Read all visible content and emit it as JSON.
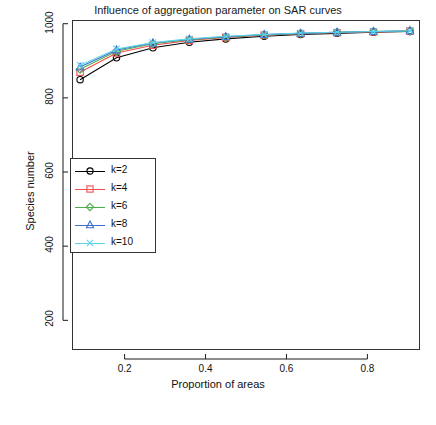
{
  "chart_data": {
    "type": "line",
    "title": "Influence of aggregation parameter on SAR curves",
    "xlabel": "Proportion of areas",
    "ylabel": "Species number",
    "xlim": [
      0.07,
      0.93
    ],
    "ylim": [
      120,
      1010
    ],
    "xticks": [
      "0.2",
      "0.4",
      "0.6",
      "0.8"
    ],
    "xtick_values": [
      0.2,
      0.4,
      0.6,
      0.8
    ],
    "yticks": [
      "200",
      "400",
      "600",
      "800",
      "1000"
    ],
    "ytick_values": [
      200,
      400,
      600,
      800,
      1000
    ],
    "grid": false,
    "legend_position": "left-middle",
    "x": [
      0.09,
      0.18,
      0.27,
      0.36,
      0.45,
      0.545,
      0.635,
      0.725,
      0.815,
      0.905
    ],
    "series": [
      {
        "name": "k=2",
        "color": "#000000",
        "marker": "circle",
        "values": [
          849,
          908,
          935,
          950,
          959,
          966,
          971,
          974,
          977,
          979
        ]
      },
      {
        "name": "k=4",
        "color": "#f24d4d",
        "marker": "square",
        "values": [
          869,
          921,
          942,
          955,
          963,
          969,
          973,
          976,
          978,
          980
        ]
      },
      {
        "name": "k=6",
        "color": "#4daf4a",
        "marker": "diamond",
        "values": [
          877,
          926,
          946,
          957,
          964,
          970,
          974,
          977,
          979,
          980
        ]
      },
      {
        "name": "k=8",
        "color": "#3b6fd4",
        "marker": "triangle",
        "values": [
          883,
          929,
          948,
          958,
          965,
          971,
          974,
          977,
          979,
          981
        ]
      },
      {
        "name": "k=10",
        "color": "#5fd5e8",
        "marker": "x",
        "values": [
          888,
          932,
          949,
          959,
          966,
          971,
          975,
          977,
          979,
          981
        ]
      }
    ]
  }
}
